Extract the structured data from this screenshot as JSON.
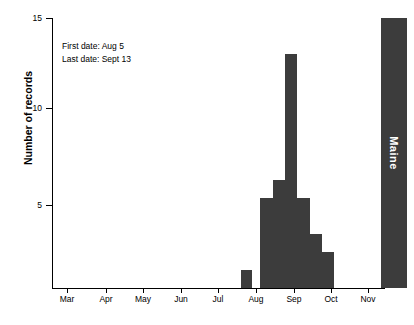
{
  "chart_data": {
    "type": "bar",
    "title": "",
    "subtitle": "",
    "xlabel": "",
    "ylabel": "Number of records",
    "ylim": [
      0,
      15
    ],
    "yticks": [
      5,
      10,
      15
    ],
    "ytick_labels": [
      "5",
      "10",
      "15"
    ],
    "xlim_months": [
      "Mar",
      "Dec"
    ],
    "xtick_labels": [
      "Mar",
      "Apr",
      "May",
      "Jun",
      "Jul",
      "Aug",
      "Sep",
      "Oct",
      "Nov"
    ],
    "grid": false,
    "legend": null,
    "bar_color": "#3c3c3c",
    "background": "#ffffff",
    "axis_color": "#000000",
    "categories": [
      "Aug wk1",
      "Aug wk4",
      "Sep wk1",
      "Sep wk2",
      "Sep wk3",
      "Sep wk4",
      "Oct wk1"
    ],
    "values": [
      1,
      5,
      6,
      13,
      5,
      3,
      2
    ],
    "annotations": [
      "First date: Aug 5",
      "Last date: Sept 13"
    ],
    "panel_label": "Maine",
    "panel_label_color": "#ffffff",
    "panel_band_color": "#3c3c3c",
    "bars": [
      {
        "label": "Aug wk1",
        "value": 1,
        "x_px": 189,
        "width_px": 11
      },
      {
        "label": "Aug wk4",
        "value": 5,
        "x_px": 208,
        "width_px": 13
      },
      {
        "label": "Sep wk1",
        "value": 6,
        "x_px": 221,
        "width_px": 12
      },
      {
        "label": "Sep wk2",
        "value": 13,
        "x_px": 233,
        "width_px": 12
      },
      {
        "label": "Sep wk3",
        "value": 5,
        "x_px": 245,
        "width_px": 13
      },
      {
        "label": "Sep wk4",
        "value": 3,
        "x_px": 258,
        "width_px": 12
      },
      {
        "label": "Oct wk1",
        "value": 2,
        "x_px": 270,
        "width_px": 12
      }
    ],
    "ytick_px": [
      {
        "v": 15,
        "y": 18
      },
      {
        "v": 10,
        "y": 108
      },
      {
        "v": 5,
        "y": 205
      }
    ],
    "xtick_px": [
      {
        "label": "Mar",
        "x": 67
      },
      {
        "label": "Apr",
        "x": 106
      },
      {
        "label": "May",
        "x": 143
      },
      {
        "label": "Jun",
        "x": 181
      },
      {
        "label": "Jul",
        "x": 218
      },
      {
        "label": "Aug",
        "x": 256
      },
      {
        "label": "Sep",
        "x": 294
      },
      {
        "label": "Oct",
        "x": 331
      },
      {
        "label": "Nov",
        "x": 368
      }
    ]
  }
}
